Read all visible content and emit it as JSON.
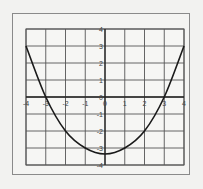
{
  "chart_data": {
    "type": "line",
    "title": "",
    "xlabel": "",
    "ylabel": "",
    "xlim": [
      -4,
      4
    ],
    "ylim": [
      -4,
      4
    ],
    "grid": true,
    "x_ticks": [
      "-4",
      "-3",
      "-2",
      "-1",
      "0",
      "1",
      "2",
      "3",
      "4"
    ],
    "y_ticks": [
      "4",
      "3",
      "2",
      "1",
      "0",
      "-1",
      "-2",
      "-3",
      "-4"
    ],
    "series": [
      {
        "name": "curve",
        "x": [
          -4,
          -3,
          -2,
          -1,
          0,
          1,
          2,
          3,
          4
        ],
        "y": [
          3,
          0,
          -2,
          -3,
          -3.35,
          -3,
          -2,
          0,
          3
        ]
      }
    ],
    "colors": {
      "curve": "#1a1a1a",
      "grid": "#555555",
      "axes": "#222222",
      "frame": "#8a8a8a",
      "background": "#f4f4f2"
    }
  }
}
